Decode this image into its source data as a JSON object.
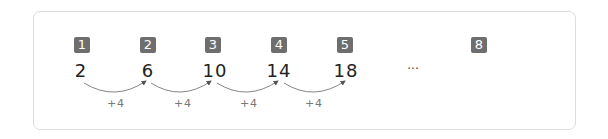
{
  "sequence": {
    "terms": [
      {
        "index": "1",
        "value": "2"
      },
      {
        "index": "2",
        "value": "6"
      },
      {
        "index": "3",
        "value": "10"
      },
      {
        "index": "4",
        "value": "14"
      },
      {
        "index": "5",
        "value": "18"
      }
    ],
    "ellipsis": "···",
    "last_index": "8",
    "last_value": "",
    "step_labels": [
      "+4",
      "+4",
      "+4",
      "+4"
    ]
  },
  "colors": {
    "badge": "#6e6e6e",
    "arc": "#555555",
    "border": "#dcdcdc"
  }
}
